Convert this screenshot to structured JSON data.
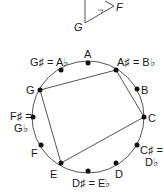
{
  "top_figure": {
    "labels": {
      "g": "G",
      "f": "F"
    }
  },
  "circle": {
    "notes": [
      {
        "name": "A",
        "label": "A"
      },
      {
        "name": "A#/Bb",
        "label": "A♯ = B♭"
      },
      {
        "name": "B",
        "label": "B"
      },
      {
        "name": "C",
        "label": "C"
      },
      {
        "name": "C#/Db",
        "label_1": "C♯ =",
        "label_2": "D♭"
      },
      {
        "name": "D",
        "label": "D"
      },
      {
        "name": "D#/Eb",
        "label": "D♯ = E♭"
      },
      {
        "name": "E",
        "label": "E"
      },
      {
        "name": "F",
        "label": "F"
      },
      {
        "name": "F#/Gb",
        "label_1": "F♯ =",
        "label_2": "G♭"
      },
      {
        "name": "G",
        "label": "G"
      },
      {
        "name": "G#/Ab",
        "label": "G♯ = A♭"
      }
    ],
    "polygon": [
      "G",
      "A#",
      "C",
      "E"
    ]
  },
  "colors": {
    "line": "#555555",
    "dot": "#111111",
    "text": "#1a1a1a"
  }
}
